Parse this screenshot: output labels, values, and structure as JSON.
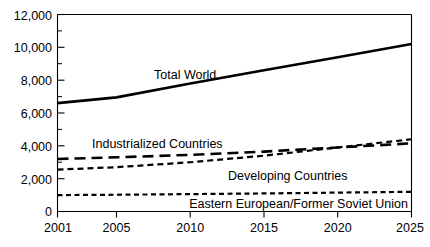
{
  "chart_data": {
    "type": "line",
    "title": "",
    "subtitle": "",
    "xlabel": "",
    "ylabel": "",
    "xlim": [
      2001,
      2025
    ],
    "ylim": [
      0,
      12000
    ],
    "grid": false,
    "legend_position": "inline-annotations",
    "x_ticks": [
      2001,
      2005,
      2010,
      2015,
      2020,
      2025
    ],
    "x_tick_labels": [
      "2001",
      "2005",
      "2010",
      "2015",
      "2020",
      "2025"
    ],
    "y_ticks": [
      0,
      2000,
      4000,
      6000,
      8000,
      10000,
      12000
    ],
    "y_tick_labels": [
      "0",
      "2,000",
      "4,000",
      "6,000",
      "8,000",
      "10,000",
      "12,000"
    ],
    "y_minor_ticks": [
      1000,
      3000,
      5000,
      7000,
      9000,
      11000
    ],
    "x": [
      2001,
      2005,
      2010,
      2015,
      2020,
      2025
    ],
    "series": [
      {
        "name": "Total World",
        "label": "Total World",
        "style": "solid",
        "values": [
          6600,
          6950,
          7800,
          8600,
          9400,
          10200
        ]
      },
      {
        "name": "Industrialized Countries",
        "label": "Industrialized Countries",
        "style": "long-dash",
        "values": [
          3200,
          3300,
          3450,
          3650,
          3900,
          4150
        ]
      },
      {
        "name": "Developing Countries",
        "label": "Developing Countries",
        "style": "short-dash",
        "values": [
          2550,
          2700,
          3000,
          3400,
          3900,
          4400
        ]
      },
      {
        "name": "Eastern European/Former Soviet Union",
        "label": "Eastern European/Former Soviet Union",
        "style": "dotted-dash",
        "values": [
          1000,
          1020,
          1060,
          1100,
          1150,
          1200
        ]
      }
    ],
    "annotations": [
      {
        "text": "Total World",
        "x": 2009.0,
        "y": 8350
      },
      {
        "text": "Industrialized Countries",
        "x": 2006.2,
        "y": 4000
      },
      {
        "text": "Developing Countries",
        "x": 2018.2,
        "y": 2500
      },
      {
        "text": "Eastern European/Former Soviet Union",
        "x": 2024.6,
        "y": 700
      }
    ],
    "colors": {
      "line": "#000000",
      "axis": "#000000",
      "background": "#ffffff",
      "text": "#000000"
    }
  }
}
